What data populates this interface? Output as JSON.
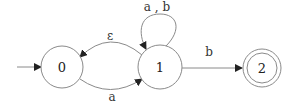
{
  "diagram": {
    "type": "finite-automaton",
    "colors": {
      "stroke": "#8a8a8a",
      "text": "#333333",
      "background": "#ffffff"
    },
    "start_state": "0",
    "states": [
      {
        "id": "0",
        "label": "0",
        "accepting": false
      },
      {
        "id": "1",
        "label": "1",
        "accepting": false
      },
      {
        "id": "2",
        "label": "2",
        "accepting": true
      }
    ],
    "transitions": [
      {
        "from": "0",
        "to": "1",
        "label": "a"
      },
      {
        "from": "1",
        "to": "0",
        "label": "ε"
      },
      {
        "from": "1",
        "to": "1",
        "label": "a , b"
      },
      {
        "from": "1",
        "to": "2",
        "label": "b"
      }
    ]
  }
}
